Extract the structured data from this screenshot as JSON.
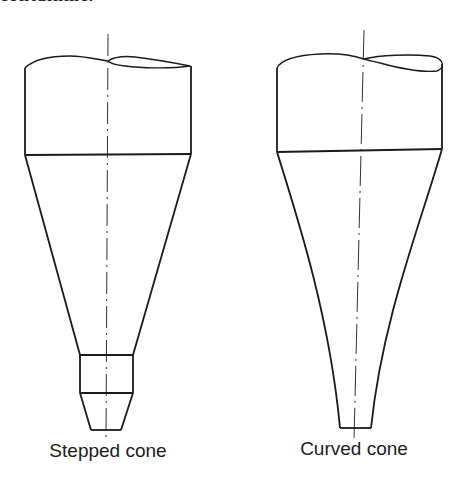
{
  "header_fragment": "containment.",
  "figures": [
    {
      "id": "stepped",
      "label": "Stepped cone",
      "parts": [
        "cylinder-body",
        "conical-section",
        "cylindrical-step",
        "lower-frustum",
        "centre-line"
      ]
    },
    {
      "id": "curved",
      "label": "Curved cone",
      "parts": [
        "cylinder-body",
        "curved-conical-section",
        "centre-line"
      ]
    }
  ],
  "colors": {
    "line": "#1a1a1a",
    "background": "#ffffff"
  }
}
